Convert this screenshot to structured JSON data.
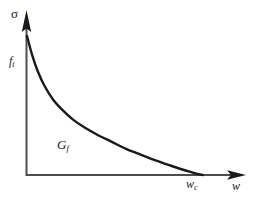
{
  "figure": {
    "background_color": "#ffffff",
    "ink_color": "#1a1a1a",
    "width": 261,
    "height": 198
  },
  "labels": {
    "y_axis": "σ",
    "x_axis_symbol": "w",
    "x_axis_sub": "",
    "peak_stress_symbol": "f",
    "peak_stress_sub": "t",
    "fracture_energy_symbol": "G",
    "fracture_energy_sub": "f",
    "critical_opening_symbol": "w",
    "critical_opening_sub": "c"
  },
  "chart_data": {
    "type": "line",
    "title": "",
    "subtitle": "",
    "xlabel": "w",
    "ylabel": "σ",
    "grid": false,
    "legend": "none",
    "xlim": [
      0,
      1.24
    ],
    "ylim": [
      0,
      1.18
    ],
    "annotations": [
      {
        "text": "σ",
        "role": "y-axis-title",
        "x": 0,
        "y": 1.18
      },
      {
        "text": "f_t",
        "role": "y-intercept-tick",
        "x": 0,
        "y": 1.0
      },
      {
        "text": "G_f",
        "role": "area-under-curve-label",
        "x": 0.33,
        "y": 0.26
      },
      {
        "text": "w_c",
        "role": "x-intercept-tick",
        "x": 1.0,
        "y": 0
      },
      {
        "text": "w",
        "role": "x-axis-title",
        "x": 1.24,
        "y": 0
      }
    ],
    "series": [
      {
        "name": "softening curve",
        "description": "Tensile stress σ decreasing convexly from f_t at w=0 to zero at the critical crack opening w_c",
        "x": [
          0.0,
          0.03,
          0.06,
          0.1,
          0.15,
          0.2,
          0.26,
          0.33,
          0.4,
          0.48,
          0.56,
          0.64,
          0.72,
          0.8,
          0.87,
          0.93,
          0.97,
          1.0
        ],
        "y": [
          1.0,
          0.86,
          0.75,
          0.64,
          0.54,
          0.47,
          0.4,
          0.34,
          0.29,
          0.24,
          0.19,
          0.15,
          0.11,
          0.075,
          0.045,
          0.022,
          0.008,
          0.0
        ]
      }
    ]
  }
}
